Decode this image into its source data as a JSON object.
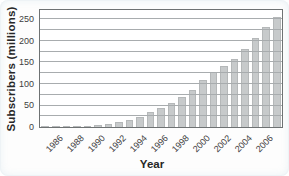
{
  "figure": {
    "y_axis_title": "Subscribers (millions)",
    "x_axis_title": "Year"
  },
  "chart_data": {
    "type": "bar",
    "title": "",
    "xlabel": "Year",
    "ylabel": "Subscribers (millions)",
    "categories": [
      1985,
      1986,
      1987,
      1988,
      1989,
      1990,
      1991,
      1992,
      1993,
      1994,
      1995,
      1996,
      1997,
      1998,
      1999,
      2000,
      2001,
      2002,
      2003,
      2004,
      2005,
      2006,
      2007
    ],
    "values": [
      0.3,
      0.7,
      1.2,
      2.1,
      3.5,
      5.3,
      7.6,
      11.0,
      16.0,
      24.1,
      33.8,
      44.0,
      55.3,
      69.2,
      86.0,
      109.5,
      128.4,
      140.8,
      158.7,
      182.1,
      207.9,
      233.0,
      255.4
    ],
    "yticks": [
      0,
      50,
      100,
      150,
      200,
      250
    ],
    "xtick_labels": [
      "1986",
      "1988",
      "1990",
      "1992",
      "1994",
      "1996",
      "1998",
      "2000",
      "2002",
      "2004",
      "2006"
    ],
    "xtick_bar_indices": [
      1,
      3,
      5,
      7,
      9,
      11,
      13,
      15,
      17,
      19,
      21
    ],
    "ylim": [
      0,
      272
    ],
    "grid": true,
    "grid_step": 25,
    "legend": "none",
    "bar_color": "#c7cacb",
    "bar_edge_color": "#b5b8b9",
    "grid_color": "#a8acae",
    "plot_border_color": "#6e7273",
    "text_color": "#272727"
  }
}
